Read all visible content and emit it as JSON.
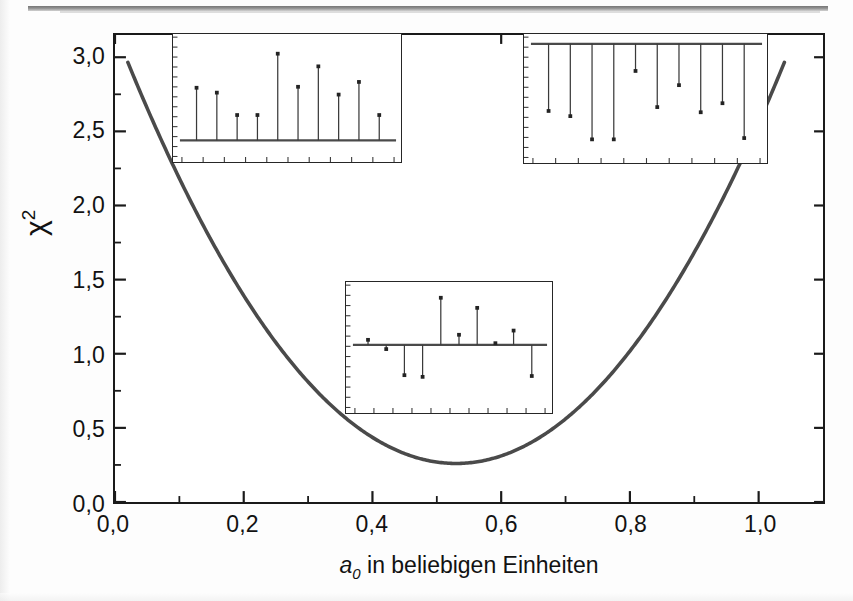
{
  "figure": {
    "background_color": "#ffffff",
    "curve_color": "#4a4a4a",
    "axis_color": "#1a1a1a",
    "inset_border_color": "#262626",
    "stem_color": "#3a3a3a"
  },
  "axes": {
    "x_title_var": "a",
    "x_title_sub": "0",
    "x_title_rest": " in beliebigen Einheiten",
    "y_title_base": "χ",
    "y_title_sup": "2",
    "x_ticks": [
      "0,0",
      "0,2",
      "0,4",
      "0,6",
      "0,8",
      "1,0"
    ],
    "y_ticks": [
      "0,0",
      "0,5",
      "1,0",
      "1,5",
      "2,0",
      "2,5",
      "3,0"
    ]
  },
  "chart_data": {
    "type": "line",
    "title": "",
    "xlabel": "a_0 in beliebigen Einheiten",
    "ylabel": "chi^2",
    "xlim": [
      0.0,
      1.1
    ],
    "ylim": [
      0.0,
      3.15
    ],
    "x_ticks": [
      0.0,
      0.2,
      0.4,
      0.6,
      0.8,
      1.0
    ],
    "y_ticks": [
      0.0,
      0.5,
      1.0,
      1.5,
      2.0,
      2.5,
      3.0
    ],
    "x_minor_ticks": [
      0.1,
      0.3,
      0.5,
      0.7,
      0.9
    ],
    "y_minor_ticks": [
      0.25,
      0.75,
      1.25,
      1.75,
      2.25,
      2.75
    ],
    "grid": false,
    "legend": false,
    "series": [
      {
        "name": "chi-squared parabola",
        "kind": "parabola",
        "vertex_x": 0.53,
        "vertex_y": 0.26,
        "curvature": 10.4,
        "x_start": 0.02,
        "x_end": 1.04,
        "y_at_x_start": 2.87,
        "y_at_x_end": 2.88,
        "x": [
          0.02,
          0.06,
          0.1,
          0.14,
          0.18,
          0.22,
          0.26,
          0.3,
          0.34,
          0.38,
          0.42,
          0.46,
          0.5,
          0.53,
          0.56,
          0.6,
          0.64,
          0.68,
          0.72,
          0.76,
          0.8,
          0.84,
          0.88,
          0.92,
          0.96,
          1.0,
          1.04
        ],
        "y": [
          2.87,
          2.45,
          2.06,
          1.71,
          1.39,
          1.11,
          0.86,
          0.65,
          0.48,
          0.34,
          0.24,
          0.21,
          0.27,
          0.26,
          0.27,
          0.31,
          0.39,
          0.51,
          0.66,
          0.85,
          1.08,
          1.35,
          1.65,
          1.99,
          2.36,
          2.77,
          2.88
        ]
      }
    ]
  },
  "insets": [
    {
      "name": "inset-top-left",
      "position": "top-left",
      "type": "stem",
      "description": "residuals all positive, baseline at bottom",
      "baseline_value": 0.0,
      "n_points": 10,
      "values": [
        0.54,
        0.49,
        0.26,
        0.26,
        0.89,
        0.55,
        0.76,
        0.47,
        0.6,
        0.26
      ],
      "x_tick_count": 11,
      "y_tick_count": 13
    },
    {
      "name": "inset-top-right",
      "position": "top-right",
      "type": "stem",
      "description": "residuals all negative, baseline at top",
      "baseline_value": 0.0,
      "n_points": 10,
      "values": [
        -0.52,
        -0.56,
        -0.74,
        -0.74,
        -0.21,
        -0.49,
        -0.32,
        -0.53,
        -0.46,
        -0.73
      ],
      "x_tick_count": 11,
      "y_tick_count": 13
    },
    {
      "name": "inset-bottom-center",
      "position": "bottom-center",
      "type": "stem",
      "description": "residuals scattered about zero baseline",
      "baseline_value": 0.0,
      "n_points": 10,
      "values": [
        0.06,
        -0.05,
        -0.36,
        -0.38,
        0.56,
        0.12,
        0.44,
        0.02,
        0.17,
        -0.37
      ],
      "x_tick_count": 11,
      "y_tick_count": 13
    }
  ]
}
